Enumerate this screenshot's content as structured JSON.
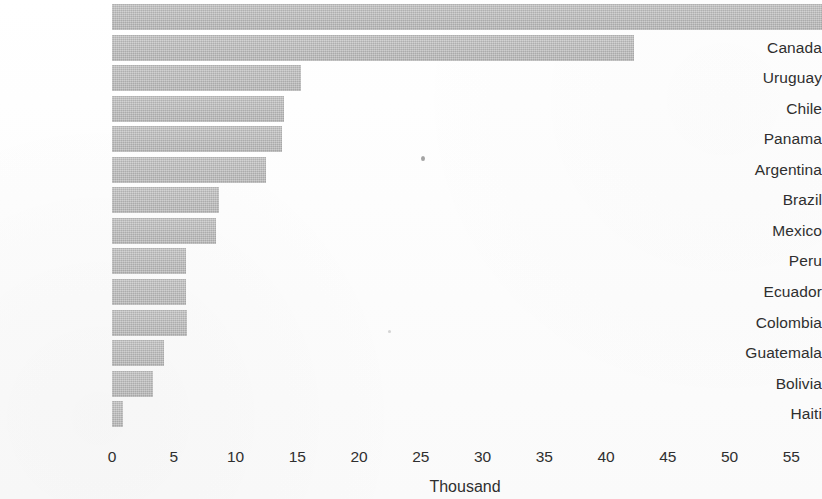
{
  "chart_data": {
    "type": "bar",
    "orientation": "horizontal",
    "title": "",
    "subtitle": "",
    "xlabel": "Thousand",
    "ylabel": "",
    "categories": [
      "United States",
      "Canada",
      "Uruguay",
      "Chile",
      "Panama",
      "Argentina",
      "Brazil",
      "Mexico",
      "Peru",
      "Ecuador",
      "Colombia",
      "Guatemala",
      "Bolivia",
      "Haiti"
    ],
    "values": [
      57.5,
      42.3,
      15.3,
      13.9,
      13.8,
      12.5,
      8.7,
      8.4,
      6.0,
      6.0,
      6.1,
      4.2,
      3.3,
      0.9
    ],
    "value_notes": {
      "United States": "bar extends past the right edge of the figure; value is clipped at the plot boundary"
    },
    "xlim": [
      0,
      57.4
    ],
    "xticks": [
      0,
      5,
      10,
      15,
      20,
      25,
      30,
      35,
      40,
      45,
      50,
      55
    ],
    "xticklabels": [
      "0",
      "5",
      "10",
      "15",
      "20",
      "25",
      "30",
      "35",
      "40",
      "45",
      "50",
      "55"
    ],
    "grid": false,
    "legend": null,
    "legend_position": "none",
    "bar_color": "#bdbdbd",
    "text_color": "#2f2f2f",
    "background_color": "#fdfdfd",
    "annotations": []
  },
  "axis": {
    "x_title": "Thousand"
  }
}
